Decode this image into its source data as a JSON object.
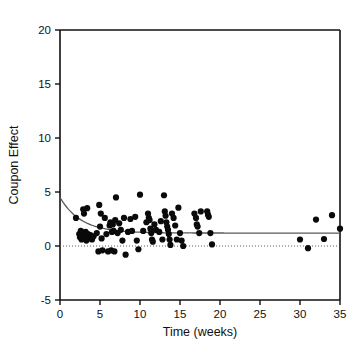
{
  "figure": {
    "top_partial_text": "",
    "background": "#ffffff",
    "point_color": "#0a0a0a",
    "axis_color": "#111111",
    "curve_color": "#5a5a5a",
    "zero_line_color": "#4a4a4a"
  },
  "chart_data": {
    "type": "scatter",
    "title": "",
    "xlabel": "Time (weeks)",
    "ylabel": "Coupon Effect",
    "xlim": [
      0,
      35
    ],
    "ylim": [
      -5,
      20
    ],
    "xticks": [
      0,
      5,
      10,
      15,
      20,
      25,
      30,
      35
    ],
    "yticks": [
      -5,
      0,
      5,
      10,
      15,
      20
    ],
    "xtick_labels": [
      "0",
      "5",
      "10",
      "15",
      "20",
      "25",
      "30",
      "35"
    ],
    "ytick_labels": [
      "-5",
      "0",
      "5",
      "10",
      "15",
      "20"
    ],
    "grid": false,
    "legend": null,
    "annotations": [
      {
        "name": "zero-reference-line",
        "type": "hline",
        "y": 0,
        "style": "dotted"
      },
      {
        "name": "fitted-decay-curve",
        "type": "curve",
        "description": "exponential decay fit from about 4.5 at week 0 to asymptote near 1.2"
      }
    ],
    "fit_curve": {
      "model": "exponential-decay",
      "y0": 4.5,
      "asymptote": 1.2,
      "rate": 0.38,
      "x_start": 0,
      "x_end": 35
    },
    "series": [
      {
        "name": "Coupon Effect observations",
        "marker": "filled-circle",
        "color": "#0a0a0a",
        "points": [
          [
            2.0,
            2.6
          ],
          [
            2.4,
            1.1
          ],
          [
            2.5,
            0.8
          ],
          [
            2.6,
            1.4
          ],
          [
            2.7,
            0.6
          ],
          [
            2.8,
            1.0
          ],
          [
            2.9,
            3.4
          ],
          [
            3.0,
            3.0
          ],
          [
            3.1,
            0.9
          ],
          [
            3.2,
            1.3
          ],
          [
            3.3,
            0.5
          ],
          [
            3.4,
            3.5
          ],
          [
            3.5,
            1.1
          ],
          [
            3.6,
            0.7
          ],
          [
            3.8,
            1.0
          ],
          [
            4.0,
            0.6
          ],
          [
            4.2,
            0.9
          ],
          [
            4.6,
            1.2
          ],
          [
            4.8,
            -0.5
          ],
          [
            4.9,
            3.8
          ],
          [
            5.0,
            1.8
          ],
          [
            5.1,
            3.0
          ],
          [
            5.2,
            0.7
          ],
          [
            5.3,
            -0.4
          ],
          [
            5.6,
            2.6
          ],
          [
            5.8,
            1.1
          ],
          [
            6.0,
            -0.5
          ],
          [
            6.2,
            1.9
          ],
          [
            6.3,
            2.2
          ],
          [
            6.4,
            -0.4
          ],
          [
            6.5,
            1.3
          ],
          [
            6.6,
            2.0
          ],
          [
            6.7,
            1.4
          ],
          [
            6.8,
            -0.5
          ],
          [
            6.9,
            2.4
          ],
          [
            7.0,
            4.5
          ],
          [
            7.2,
            1.2
          ],
          [
            7.4,
            2.1
          ],
          [
            7.6,
            1.5
          ],
          [
            7.8,
            0.5
          ],
          [
            8.0,
            2.6
          ],
          [
            8.2,
            -0.8
          ],
          [
            8.5,
            1.3
          ],
          [
            8.8,
            2.5
          ],
          [
            9.0,
            1.4
          ],
          [
            9.4,
            2.7
          ],
          [
            9.6,
            0.5
          ],
          [
            9.8,
            -0.3
          ],
          [
            10.0,
            4.75
          ],
          [
            10.4,
            1.4
          ],
          [
            10.8,
            2.2
          ],
          [
            11.0,
            3.0
          ],
          [
            11.1,
            2.6
          ],
          [
            11.2,
            2.4
          ],
          [
            11.3,
            1.6
          ],
          [
            11.4,
            1.2
          ],
          [
            11.5,
            0.6
          ],
          [
            11.6,
            0.4
          ],
          [
            11.8,
            2.0
          ],
          [
            12.0,
            1.5
          ],
          [
            12.4,
            1.3
          ],
          [
            12.6,
            2.3
          ],
          [
            12.8,
            0.6
          ],
          [
            13.0,
            4.7
          ],
          [
            13.1,
            3.2
          ],
          [
            13.2,
            2.8
          ],
          [
            13.3,
            2.2
          ],
          [
            13.4,
            1.8
          ],
          [
            13.5,
            1.5
          ],
          [
            13.6,
            1.1
          ],
          [
            13.7,
            0.6
          ],
          [
            13.8,
            0.1
          ],
          [
            14.0,
            3.0
          ],
          [
            14.2,
            2.6
          ],
          [
            14.4,
            1.9
          ],
          [
            14.6,
            0.6
          ],
          [
            14.8,
            3.55
          ],
          [
            15.0,
            1.2
          ],
          [
            15.2,
            0.5
          ],
          [
            15.4,
            0.0
          ],
          [
            16.8,
            3.0
          ],
          [
            17.0,
            2.6
          ],
          [
            17.1,
            2.0
          ],
          [
            17.2,
            1.8
          ],
          [
            17.4,
            1.2
          ],
          [
            17.6,
            3.2
          ],
          [
            18.4,
            3.2
          ],
          [
            18.5,
            2.9
          ],
          [
            18.6,
            2.7
          ],
          [
            18.8,
            1.2
          ],
          [
            19.0,
            0.15
          ],
          [
            30.0,
            0.6
          ],
          [
            31.0,
            -0.2
          ],
          [
            32.0,
            2.45
          ],
          [
            33.0,
            0.65
          ],
          [
            34.0,
            2.85
          ],
          [
            35.0,
            1.6
          ]
        ]
      }
    ]
  }
}
